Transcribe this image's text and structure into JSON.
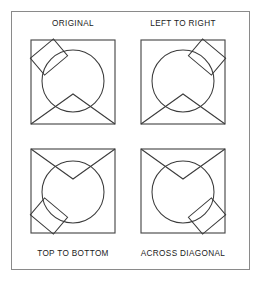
{
  "figure": {
    "background_color": "#ffffff",
    "outer_frame_color": "#8a8a8a",
    "stroke_color": "#3b3b3b",
    "label_color": "#1a1a1a"
  },
  "panels": [
    {
      "id": "original",
      "label": "ORIGINAL",
      "label_position": "top",
      "transform": "none",
      "chevron_apex": "up",
      "rectangle_corner": "upper-left"
    },
    {
      "id": "left-to-right",
      "label": "LEFT TO RIGHT",
      "label_position": "top",
      "transform": "mirror-horizontal",
      "chevron_apex": "up",
      "rectangle_corner": "upper-right"
    },
    {
      "id": "top-to-bottom",
      "label": "TOP TO BOTTOM",
      "label_position": "bottom",
      "transform": "mirror-vertical",
      "chevron_apex": "down",
      "rectangle_corner": "lower-left"
    },
    {
      "id": "across-diagonal",
      "label": "ACROSS DIAGONAL",
      "label_position": "bottom",
      "transform": "rotate-180",
      "chevron_apex": "down",
      "rectangle_corner": "lower-right"
    }
  ],
  "shapes": {
    "square": {
      "x": 10,
      "y": 8,
      "width": 84,
      "height": 84
    },
    "circle": {
      "cx": 52,
      "cy": 49,
      "r": 31
    },
    "chevron": {
      "left_x": 10,
      "left_y": 92,
      "apex_x": 52,
      "apex_y": 62,
      "right_x": 94,
      "right_y": 92
    },
    "rectangle": {
      "cx": 28,
      "cy": 25,
      "width": 30,
      "height": 22,
      "rotation_deg": -40
    }
  }
}
